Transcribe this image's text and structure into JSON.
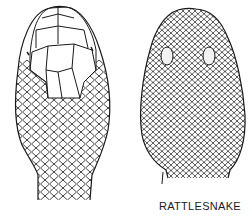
{
  "figure": {
    "left_head": {
      "description": "snake head with large head plates"
    },
    "right_head": {
      "description": "rattlesnake head with small scales and pits"
    }
  },
  "labels": {
    "right_caption": "RATTLESNAKE"
  },
  "colors": {
    "ink": "#1a1a1a",
    "background": "#ffffff"
  }
}
